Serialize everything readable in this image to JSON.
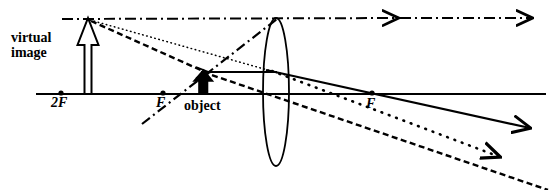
{
  "figure": {
    "labels": {
      "virtual_image_line1": "virtual",
      "virtual_image_line2": "image",
      "object": "object",
      "two_f_left": "2F",
      "f_left": "F",
      "f_right": "F"
    },
    "colors": {
      "ink": "#000000",
      "background": "#ffffff"
    },
    "geometry": {
      "width": 550,
      "height": 190,
      "axis_y": 94,
      "axis_x_start": 36,
      "axis_x_end": 546,
      "lens_center_x": 276,
      "lens_top_y": 18,
      "lens_bottom_y": 166,
      "lens_half_width": 13,
      "points": {
        "two_f_left": [
          61,
          93
        ],
        "f_left": [
          163,
          93
        ],
        "f_right": [
          372,
          93
        ],
        "object_base": [
          203,
          94
        ],
        "object_tip": [
          203,
          71
        ],
        "image_base": [
          88,
          94
        ],
        "image_tip": [
          88,
          18
        ]
      }
    },
    "rays": [
      {
        "name": "parallel-ray-dashdot",
        "style": "dash-dot",
        "from": [
          62,
          19
        ],
        "to": [
          546,
          18
        ],
        "arrowheads_at": [
          [
            400,
            18
          ],
          [
            533,
            18
          ]
        ],
        "description": "horizontal dash-dot ray along image-tip height continuing right with two arrowheads"
      },
      {
        "name": "focal-ray-dashdot",
        "style": "dash-dot",
        "from": [
          143,
          123
        ],
        "to": [
          276,
          18
        ],
        "description": "ray through left F and object tip rising to top of lens"
      },
      {
        "name": "dotted-construction-ray",
        "style": "fine-dotted",
        "from": [
          88,
          19
        ],
        "to": [
          290,
          76
        ],
        "description": "fine dotted backward extension from virtual image tip toward lens"
      },
      {
        "name": "dotted-refracted-ray",
        "style": "fine-dotted",
        "from": [
          276,
          73
        ],
        "to": [
          506,
          159
        ],
        "arrowheads_at": [
          [
            506,
            159
          ]
        ],
        "description": "dotted ray leaving lens descending to lower right"
      },
      {
        "name": "dashed-ray-image-to-object",
        "style": "bold-dashed",
        "from": [
          89,
          21
        ],
        "to": [
          203,
          72
        ],
        "description": "bold dashed line from virtual image tip to object tip"
      },
      {
        "name": "dashed-ray-through-lens",
        "style": "bold-dashed",
        "from": [
          203,
          73
        ],
        "to": [
          546,
          190
        ],
        "description": "bold dashed ray from object tip descending through lens to lower right"
      },
      {
        "name": "solid-parallel-ray",
        "style": "solid",
        "from": [
          203,
          72
        ],
        "to": [
          276,
          72
        ],
        "description": "solid horizontal ray from object tip to lens"
      },
      {
        "name": "solid-refracted-ray",
        "style": "solid",
        "from": [
          276,
          72
        ],
        "to": [
          534,
          129
        ],
        "arrowheads_at": [
          [
            534,
            129
          ]
        ],
        "description": "solid refracted ray from lens through right F to arrowhead lower right"
      }
    ]
  }
}
